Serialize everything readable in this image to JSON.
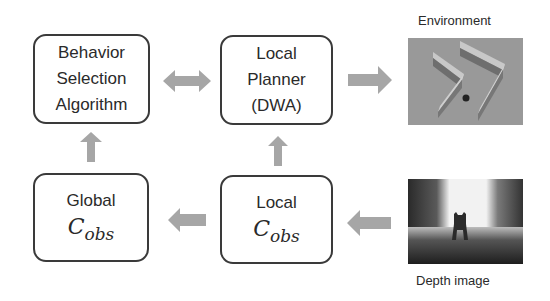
{
  "nodes": {
    "behavior": {
      "lines": [
        "Behavior",
        "Selection",
        "Algorithm"
      ]
    },
    "planner": {
      "lines": [
        "Local",
        "Planner",
        "(DWA)"
      ]
    },
    "global_cobs": {
      "title": "Global",
      "symbol": "C",
      "subscript": "obs"
    },
    "local_cobs": {
      "title": "Local",
      "symbol": "C",
      "subscript": "obs"
    }
  },
  "images": {
    "environment": {
      "label": "Environment"
    },
    "depth": {
      "label": "Depth image"
    }
  },
  "edges": [
    {
      "from": "behavior",
      "to": "planner",
      "type": "bidirectional"
    },
    {
      "from": "planner",
      "to": "environment",
      "type": "right"
    },
    {
      "from": "depth",
      "to": "local_cobs",
      "type": "left"
    },
    {
      "from": "local_cobs",
      "to": "global_cobs",
      "type": "left"
    },
    {
      "from": "local_cobs",
      "to": "planner",
      "type": "up"
    },
    {
      "from": "global_cobs",
      "to": "behavior",
      "type": "up"
    }
  ],
  "colors": {
    "arrow": "#a6a6a6",
    "border": "#3a3a3a"
  }
}
